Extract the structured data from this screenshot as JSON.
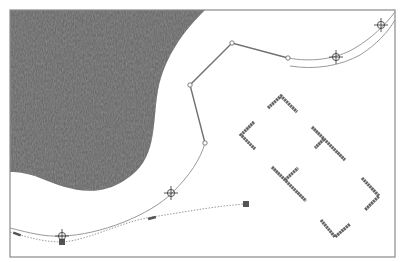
{
  "diagram": {
    "colors": {
      "background": "#ffffff",
      "frame": "#8a8a8a",
      "terrain": "#6a6a6a",
      "terrain_light": "#8c8c8c",
      "terrain_dark": "#4e4e4e",
      "route_line": "#9a9a9a",
      "polyline": "#707070",
      "dotted_curve": "#9c9c9c",
      "handle": "#555555",
      "bracket": "#666666",
      "crosshair": "#444444"
    },
    "frame": {
      "x": 10,
      "y": 10,
      "width": 385,
      "height": 247
    },
    "terrain_region": {
      "path": "M10,10 L205,10 C185,30 165,55 158,90 C152,125 158,160 125,180 C95,200 65,188 40,178 C28,173 18,172 10,172 Z"
    },
    "route": {
      "main_curve": "M10,228 C30,233 45,237 62,236 C100,235 150,215 172,193 C190,175 200,160 205,143",
      "upper_curve": "M288,58 C310,62 335,60 355,48 C372,38 385,25 395,12",
      "lower_curve": "M290,66 C315,70 340,66 360,55 C376,45 388,32 395,20"
    },
    "polyline": {
      "points": [
        [
          205,
          143
        ],
        [
          190,
          85
        ],
        [
          232,
          43
        ],
        [
          288,
          58
        ]
      ],
      "vertex_handles": [
        [
          205,
          143
        ],
        [
          190,
          85
        ],
        [
          232,
          43
        ],
        [
          288,
          58
        ]
      ]
    },
    "dotted_curve": {
      "path": "M10,232 C30,238 45,242 62,242 C90,240 120,222 152,217 C185,212 215,206 246,204",
      "handles": [
        {
          "type": "dash",
          "x": 17,
          "y": 234,
          "angle": 20
        },
        {
          "type": "square",
          "x": 62,
          "y": 242
        },
        {
          "type": "dash",
          "x": 152,
          "y": 218,
          "angle": -15
        },
        {
          "type": "square",
          "x": 246,
          "y": 204
        }
      ]
    },
    "crosshairs": [
      {
        "x": 62,
        "y": 236
      },
      {
        "x": 171,
        "y": 193
      },
      {
        "x": 336,
        "y": 57
      },
      {
        "x": 381,
        "y": 25
      }
    ],
    "brackets": [
      {
        "name": "bracket-top",
        "points": [
          [
            268,
            108
          ],
          [
            281,
            96
          ],
          [
            297,
            112
          ]
        ]
      },
      {
        "name": "bracket-left",
        "points": [
          [
            254,
            122
          ],
          [
            241,
            135
          ],
          [
            255,
            149
          ]
        ]
      },
      {
        "name": "bracket-t-upper",
        "points": [
          [
            312,
            127
          ],
          [
            345,
            160
          ]
        ],
        "stem": [
          [
            324,
            139
          ],
          [
            315,
            148
          ]
        ]
      },
      {
        "name": "bracket-t-lower",
        "points": [
          [
            272,
            167
          ],
          [
            306,
            201
          ]
        ],
        "stem": [
          [
            285,
            180
          ],
          [
            298,
            168
          ]
        ]
      },
      {
        "name": "bracket-right",
        "points": [
          [
            362,
            178
          ],
          [
            379,
            196
          ],
          [
            365,
            210
          ]
        ]
      },
      {
        "name": "bracket-bottom",
        "points": [
          [
            321,
            220
          ],
          [
            335,
            237
          ],
          [
            350,
            224
          ]
        ]
      }
    ]
  }
}
